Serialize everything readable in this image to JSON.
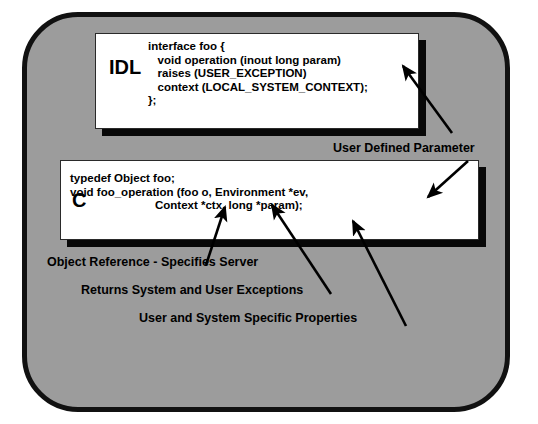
{
  "diagram": {
    "panel": {
      "fill_color": "#9c9c9c",
      "border_color": "#111111"
    },
    "boxes": [
      {
        "id": "idl",
        "language_label": "IDL",
        "code_lines": [
          "interface foo {",
          "   void operation (inout long param)",
          "   raises (USER_EXCEPTION)",
          "   context (LOCAL_SYSTEM_CONTEXT);",
          "};"
        ],
        "code_text": "interface foo {\n   void operation (inout long param)\n   raises (USER_EXCEPTION)\n   context (LOCAL_SYSTEM_CONTEXT);\n};"
      },
      {
        "id": "c",
        "language_label": "C",
        "code_lines": [
          "typedef Object foo;",
          "void foo_operation (foo o, Environment *ev,",
          "Context *ctx, long *param);"
        ],
        "code_text_line1": "typedef Object foo;\nvoid foo_operation (foo o, Environment *ev,",
        "code_text_line2": "Context *ctx, long *param);"
      }
    ],
    "annotations": [
      {
        "id": "user-defined-parameter",
        "text": "User Defined Parameter"
      },
      {
        "id": "object-reference",
        "text": "Object Reference - Specifies Server"
      },
      {
        "id": "exceptions",
        "text": "Returns System and User Exceptions"
      },
      {
        "id": "properties",
        "text": "User and System Specific Properties"
      }
    ]
  }
}
